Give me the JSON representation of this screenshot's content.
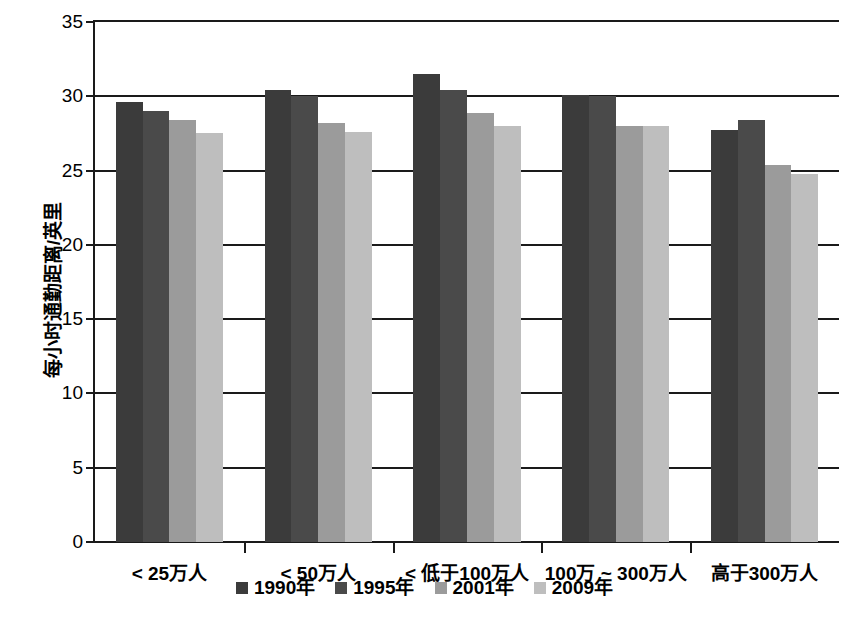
{
  "chart_data": {
    "type": "bar",
    "title": "",
    "subtitle": "",
    "xlabel": "",
    "ylabel": "每小时通勤距离/英里",
    "ylim": [
      0,
      35
    ],
    "ytick_values": [
      0,
      5,
      10,
      15,
      20,
      25,
      30,
      35
    ],
    "ytick_labels": [
      "0",
      "5",
      "10",
      "15",
      "20",
      "25",
      "30",
      "35"
    ],
    "grid": true,
    "grid_axis": "y",
    "legend_position": "bottom",
    "categories": [
      "< 25万人",
      "< 50万人",
      "< 低于100万人",
      "100万 ~ 300万人",
      "高于300万人"
    ],
    "series": [
      {
        "name": "1990年",
        "color": "#3b3b3b",
        "values": [
          29.6,
          30.4,
          31.5,
          30.1,
          27.7
        ]
      },
      {
        "name": "1995年",
        "color": "#4a4a4a",
        "values": [
          29.0,
          30.0,
          30.4,
          30.0,
          28.4
        ]
      },
      {
        "name": "2001年",
        "color": "#9b9b9b",
        "values": [
          28.4,
          28.2,
          28.9,
          28.0,
          25.4
        ]
      },
      {
        "name": "2009年",
        "color": "#bebebe",
        "values": [
          27.5,
          27.6,
          28.0,
          28.0,
          24.8
        ]
      }
    ]
  },
  "legend": {
    "items": [
      {
        "label": "1990年",
        "color": "#3b3b3b"
      },
      {
        "label": "1995年",
        "color": "#4a4a4a"
      },
      {
        "label": "2001年",
        "color": "#9b9b9b"
      },
      {
        "label": "2009年",
        "color": "#bebebe"
      }
    ]
  },
  "axis": {
    "y_title": "每小时通勤距离/英里"
  }
}
